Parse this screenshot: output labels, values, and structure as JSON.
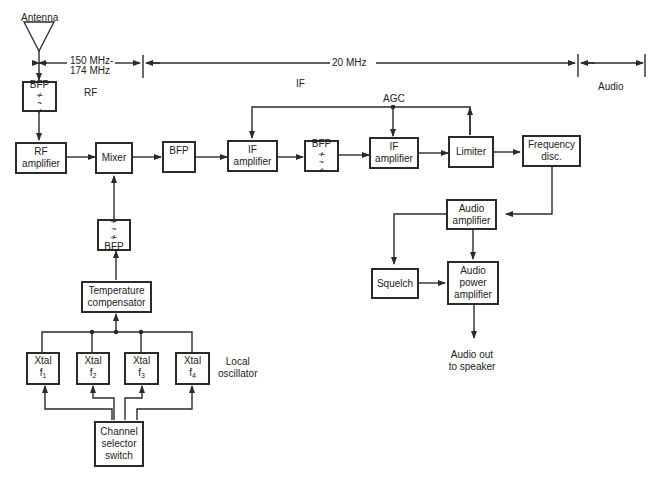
{
  "diagram": {
    "antenna_label": "Antenna",
    "bands": {
      "rf_range_line1": "150 MHz-",
      "rf_range_line2": "174 MHz",
      "if_freq": "20 MHz",
      "rf_label": "RF",
      "if_label": "IF",
      "audio_label": "Audio"
    },
    "agc_label": "AGC",
    "blocks": {
      "bfp_rf": {
        "line1": "BFP",
        "symbol": "≁\n~\n≁"
      },
      "rf_amp": {
        "line1": "RF",
        "line2": "amplifier"
      },
      "mixer": {
        "line1": "Mixer"
      },
      "bfp_if1": {
        "line1": "BFP"
      },
      "if_amp1": {
        "line1": "IF",
        "line2": "amplifier"
      },
      "bfp_if2": {
        "line1": "BFP",
        "symbol": "≁\n~\n≁"
      },
      "if_amp2": {
        "line1": "IF",
        "line2": "amplifier"
      },
      "limiter": {
        "line1": "Limiter"
      },
      "freq_disc": {
        "line1": "Frequency",
        "line2": "disc."
      },
      "bfp_lo": {
        "line1": "BFP",
        "symbol": "≁\n~\n≁"
      },
      "temp_comp": {
        "line1": "Temperature",
        "line2": "compensator"
      },
      "xtal1": {
        "line1": "Xtal",
        "line2": "f",
        "sub": "1"
      },
      "xtal2": {
        "line1": "Xtal",
        "line2": "f",
        "sub": "2"
      },
      "xtal3": {
        "line1": "Xtal",
        "line2": "f",
        "sub": "3"
      },
      "xtal4": {
        "line1": "Xtal",
        "line2": "f",
        "sub": "4"
      },
      "channel_sel": {
        "line1": "Channel",
        "line2": "selector",
        "line3": "switch"
      },
      "audio_amp": {
        "line1": "Audio",
        "line2": "amplifier"
      },
      "squelch": {
        "line1": "Squelch"
      },
      "audio_pwr": {
        "line1": "Audio",
        "line2": "power",
        "line3": "amplifier"
      }
    },
    "local_osc_label_1": "Local",
    "local_osc_label_2": "oscillator",
    "output_label_1": "Audio out",
    "output_label_2": "to speaker"
  }
}
